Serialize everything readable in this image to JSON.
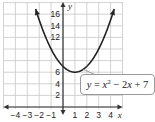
{
  "chart_data": {
    "type": "line",
    "title": "",
    "equation": "y = x^2 - 2x + 7",
    "xlabel": "x",
    "ylabel": "y",
    "xlim": [
      -5,
      5
    ],
    "ylim": [
      0,
      18
    ],
    "x_ticks": [
      -4,
      -3,
      -2,
      -1,
      1,
      2,
      3,
      4
    ],
    "y_ticks": [
      2,
      4,
      6,
      12,
      14,
      16
    ],
    "grid": true,
    "series": [
      {
        "name": "y = x^2 - 2x + 7",
        "x": [
          -2.3,
          -2,
          -1,
          0,
          1,
          2,
          3,
          4.3
        ],
        "values": [
          16.89,
          15,
          10,
          7,
          6,
          7,
          10,
          16.89
        ]
      }
    ],
    "vertex": [
      1,
      6
    ],
    "colors": {
      "curve": "#222222",
      "grid": "#c8c8c8",
      "axis": "#333333"
    }
  },
  "labels": {
    "x_axis": "x",
    "y_axis": "y",
    "eq_y": "y",
    "eq_eq": " = ",
    "eq_x": "x",
    "eq_exp": "2",
    "eq_rest1": " − 2",
    "eq_x2": "x",
    "eq_rest2": " + 7"
  }
}
